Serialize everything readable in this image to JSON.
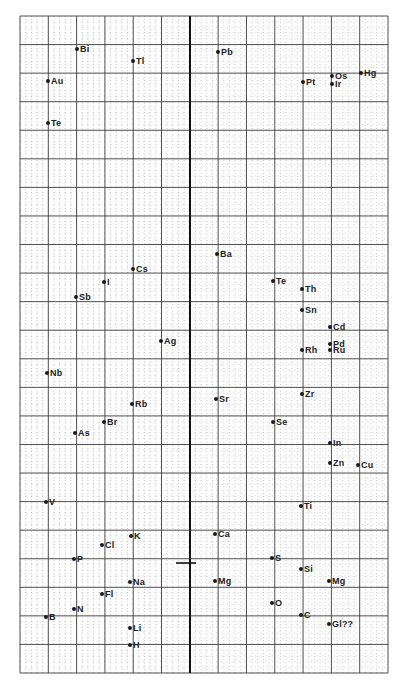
{
  "chart_data": {
    "type": "scatter",
    "title": "",
    "xlabel": "",
    "ylabel": "",
    "grid": true,
    "legend": null,
    "grid_spec": {
      "left": 20,
      "right": 388,
      "top": 16,
      "bottom": 673,
      "major_cols": 13,
      "major_rows": 23,
      "minor_per_major": 5,
      "thick_vertical_x": 190,
      "major_color": "#3a3a3a",
      "minor_color": "#9a9a9a",
      "thick_color": "#111111"
    },
    "annotation_mark": {
      "x1": 176,
      "x2": 196,
      "y": 563
    },
    "points": [
      {
        "label": "Bi",
        "x": 77,
        "y": 49
      },
      {
        "label": "Tl",
        "x": 133,
        "y": 61
      },
      {
        "label": "Pb",
        "x": 218,
        "y": 52
      },
      {
        "label": "Au",
        "x": 48,
        "y": 81
      },
      {
        "label": "Pt",
        "x": 303,
        "y": 82
      },
      {
        "label": "Os",
        "x": 332,
        "y": 76
      },
      {
        "label": "Ir",
        "x": 332,
        "y": 84
      },
      {
        "label": "Hg",
        "x": 361,
        "y": 73
      },
      {
        "label": "Te",
        "x": 48,
        "y": 123
      },
      {
        "label": "Ba",
        "x": 217,
        "y": 254
      },
      {
        "label": "Cs",
        "x": 133,
        "y": 269
      },
      {
        "label": "Te",
        "x": 273,
        "y": 281
      },
      {
        "label": "I",
        "x": 104,
        "y": 282
      },
      {
        "label": "Th",
        "x": 302,
        "y": 289
      },
      {
        "label": "Sb",
        "x": 76,
        "y": 297
      },
      {
        "label": "Sn",
        "x": 302,
        "y": 310
      },
      {
        "label": "Cd",
        "x": 330,
        "y": 327
      },
      {
        "label": "Ag",
        "x": 161,
        "y": 341
      },
      {
        "label": "Pd",
        "x": 330,
        "y": 344
      },
      {
        "label": "Rh",
        "x": 302,
        "y": 350
      },
      {
        "label": "Ru",
        "x": 330,
        "y": 350
      },
      {
        "label": "Nb",
        "x": 47,
        "y": 373
      },
      {
        "label": "Zr",
        "x": 302,
        "y": 394
      },
      {
        "label": "Sr",
        "x": 216,
        "y": 399
      },
      {
        "label": "Rb",
        "x": 132,
        "y": 404
      },
      {
        "label": "Br",
        "x": 104,
        "y": 422
      },
      {
        "label": "Se",
        "x": 273,
        "y": 422
      },
      {
        "label": "As",
        "x": 75,
        "y": 433
      },
      {
        "label": "In",
        "x": 330,
        "y": 443
      },
      {
        "label": "Zn",
        "x": 330,
        "y": 463
      },
      {
        "label": "Cu",
        "x": 358,
        "y": 465
      },
      {
        "label": "V",
        "x": 46,
        "y": 502
      },
      {
        "label": "Ti",
        "x": 301,
        "y": 506
      },
      {
        "label": "Ca",
        "x": 215,
        "y": 534
      },
      {
        "label": "K",
        "x": 131,
        "y": 536
      },
      {
        "label": "Cl",
        "x": 102,
        "y": 545
      },
      {
        "label": "S",
        "x": 272,
        "y": 558
      },
      {
        "label": "P",
        "x": 74,
        "y": 559
      },
      {
        "label": "Si",
        "x": 301,
        "y": 569
      },
      {
        "label": "Na",
        "x": 130,
        "y": 582
      },
      {
        "label": "Mg",
        "x": 215,
        "y": 581
      },
      {
        "label": "Mg",
        "x": 329,
        "y": 581
      },
      {
        "label": "Fl",
        "x": 102,
        "y": 594
      },
      {
        "label": "O",
        "x": 272,
        "y": 603
      },
      {
        "label": "N",
        "x": 74,
        "y": 609
      },
      {
        "label": "B",
        "x": 46,
        "y": 617
      },
      {
        "label": "C",
        "x": 301,
        "y": 615
      },
      {
        "label": "Gl??",
        "x": 329,
        "y": 624
      },
      {
        "label": "Li",
        "x": 130,
        "y": 628
      },
      {
        "label": "H",
        "x": 130,
        "y": 645
      }
    ]
  }
}
